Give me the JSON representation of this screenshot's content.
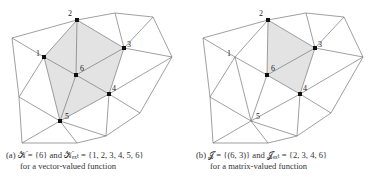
{
  "figure": {
    "panels": [
      {
        "id": "a",
        "offset_x": 0,
        "caption_line1": "(a) 𝒦 = {6} and 𝒦ₑₓₜ = {1, 2, 3, 4, 5, 6}",
        "caption_line2": "for a vector-valued function",
        "highlighted_vertices": [
          1,
          2,
          3,
          4,
          5,
          6
        ],
        "shaded_region": "hexagon around vertex 6 (1-2-3-4-5)",
        "labels": {
          "v1": "1",
          "v2": "2",
          "v3": "3",
          "v4": "4",
          "v5": "5",
          "v6": "6"
        }
      },
      {
        "id": "b",
        "offset_x": 191,
        "caption_line1": "(b) 𝒥 = {(6, 3)} and 𝒥ₑₓₜ = {2, 3, 4, 6}",
        "caption_line2": "for a matrix-valued function",
        "highlighted_vertices": [
          2,
          3,
          4,
          6
        ],
        "shaded_region": "quadrilateral 2-3-4-6",
        "labels": {
          "v1": "1",
          "v2": "2",
          "v3": "3",
          "v4": "4",
          "v5": "5",
          "v6": "6"
        }
      }
    ],
    "colors": {
      "edge": "#777777",
      "shade": "#e3e3e3",
      "vertex": "#111111"
    }
  }
}
